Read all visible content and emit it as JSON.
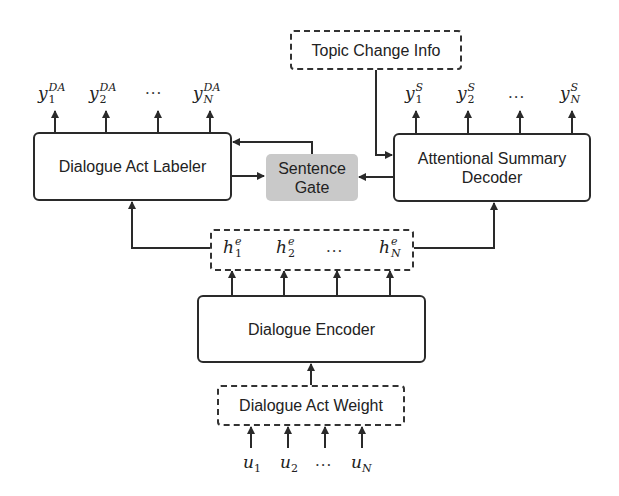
{
  "diagram": {
    "nodes": {
      "topic_change_info": {
        "label": "Topic Change Info",
        "style": "dashed"
      },
      "dialogue_act_labeler": {
        "label": "Dialogue Act Labeler",
        "style": "solid"
      },
      "sentence_gate": {
        "label_line1": "Sentence",
        "label_line2": "Gate",
        "style": "filled-gray",
        "fill": "#c9c9c9"
      },
      "attentional_summary_decoder": {
        "label_line1": "Attentional Summary",
        "label_line2": "Decoder",
        "style": "solid"
      },
      "dialogue_encoder": {
        "label": "Dialogue Encoder",
        "style": "solid"
      },
      "dialogue_act_weight": {
        "label": "Dialogue Act Weight",
        "style": "dashed"
      }
    },
    "da_outputs": [
      {
        "base": "y",
        "sup": "DA",
        "sub": "1"
      },
      {
        "base": "y",
        "sup": "DA",
        "sub": "2"
      },
      {
        "base": "y",
        "sup": "DA",
        "sub": "N"
      }
    ],
    "summary_outputs": [
      {
        "base": "y",
        "sup": "S",
        "sub": "1"
      },
      {
        "base": "y",
        "sup": "S",
        "sub": "2"
      },
      {
        "base": "y",
        "sup": "S",
        "sub": "N"
      }
    ],
    "hidden_states": [
      {
        "base": "h",
        "sup": "e",
        "sub": "1"
      },
      {
        "base": "h",
        "sup": "e",
        "sub": "2"
      },
      {
        "base": "h",
        "sup": "e",
        "sub": "N"
      }
    ],
    "inputs": [
      {
        "base": "u",
        "sub": "1"
      },
      {
        "base": "u",
        "sub": "2"
      },
      {
        "base": "u",
        "sub": "N"
      }
    ],
    "ellipsis": "···",
    "edges": [
      {
        "from": "dialogue_act_weight",
        "to": "dialogue_encoder"
      },
      {
        "from": "dialogue_encoder",
        "to": "hidden_states"
      },
      {
        "from": "hidden_states",
        "to": "dialogue_act_labeler"
      },
      {
        "from": "hidden_states",
        "to": "attentional_summary_decoder"
      },
      {
        "from": "dialogue_act_labeler",
        "to": "sentence_gate"
      },
      {
        "from": "attentional_summary_decoder",
        "to": "sentence_gate"
      },
      {
        "from": "sentence_gate",
        "to": "dialogue_act_labeler"
      },
      {
        "from": "topic_change_info",
        "to": "attentional_summary_decoder"
      },
      {
        "from": "dialogue_act_labeler",
        "to": "da_outputs"
      },
      {
        "from": "attentional_summary_decoder",
        "to": "summary_outputs"
      },
      {
        "from": "inputs",
        "to": "dialogue_act_weight"
      }
    ],
    "colors": {
      "line": "#2a2a2a",
      "gate_fill": "#c9c9c9",
      "background": "#ffffff"
    }
  }
}
